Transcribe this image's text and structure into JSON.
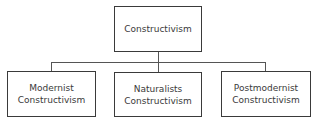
{
  "diagram": {
    "type": "hierarchy",
    "root": {
      "label": "Constructivism"
    },
    "children": [
      {
        "label": "Modernist\nConstructivism"
      },
      {
        "label": "Naturalists\nConstructivism"
      },
      {
        "label": "Postmodernist\nConstructivism"
      }
    ],
    "colors": {
      "border": "#3a3a3a",
      "line": "#555555",
      "background": "#ffffff"
    }
  }
}
